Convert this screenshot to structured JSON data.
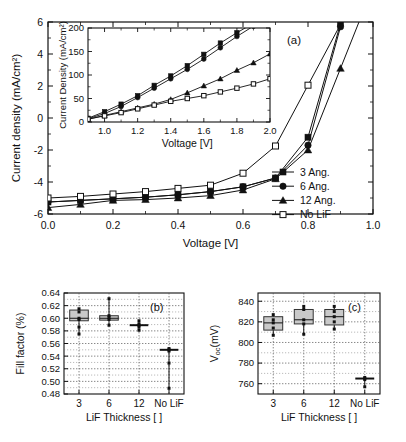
{
  "figure": {
    "panels": [
      "a",
      "b",
      "c"
    ]
  },
  "chart_data": [
    {
      "id": "panel-a",
      "type": "line",
      "panel_label": "(a)",
      "title": "",
      "xlabel": "Voltage [V]",
      "ylabel": "Current density (mA/cm²)",
      "xlim": [
        0.0,
        1.0
      ],
      "ylim": [
        -6,
        6
      ],
      "xticks": [
        0.0,
        0.2,
        0.4,
        0.6,
        0.8,
        1.0
      ],
      "xticklabels": [
        "0.0",
        "0.2",
        "0.4",
        "0.6",
        "0.8",
        "1.0"
      ],
      "yticks": [
        -6,
        -4,
        -2,
        0,
        2,
        4,
        6
      ],
      "yticklabels": [
        "-6",
        "-4",
        "-2",
        "0",
        "2",
        "4",
        "6"
      ],
      "grid": false,
      "legend_position": "lower-right",
      "series": [
        {
          "name": "3 Ang.",
          "marker": "filled-square",
          "x": [
            0.0,
            0.1,
            0.2,
            0.3,
            0.4,
            0.5,
            0.6,
            0.7,
            0.8,
            0.9
          ],
          "y": [
            -5.25,
            -5.15,
            -5.05,
            -4.95,
            -4.8,
            -4.6,
            -4.3,
            -3.75,
            -1.2,
            5.9
          ]
        },
        {
          "name": "6 Ang.",
          "marker": "filled-circle",
          "x": [
            0.0,
            0.1,
            0.2,
            0.3,
            0.4,
            0.5,
            0.6,
            0.7,
            0.8,
            0.9
          ],
          "y": [
            -5.25,
            -5.15,
            -5.05,
            -4.95,
            -4.8,
            -4.6,
            -4.3,
            -3.75,
            -1.7,
            5.7
          ]
        },
        {
          "name": "12 Ang.",
          "marker": "filled-triangle",
          "x": [
            0.0,
            0.1,
            0.2,
            0.3,
            0.4,
            0.5,
            0.6,
            0.7,
            0.8,
            0.9
          ],
          "y": [
            -5.6,
            -5.4,
            -5.15,
            -5.1,
            -5.0,
            -4.85,
            -4.5,
            -3.8,
            -2.0,
            3.1
          ]
        },
        {
          "name": "No LiF",
          "marker": "open-square",
          "x": [
            0.0,
            0.1,
            0.2,
            0.3,
            0.4,
            0.5,
            0.6,
            0.7,
            0.8
          ],
          "y": [
            -5.0,
            -4.9,
            -4.75,
            -4.6,
            -4.4,
            -4.2,
            -3.45,
            -1.75,
            2.05
          ]
        }
      ],
      "legend": [
        "3 Ang.",
        "6 Ang.",
        "12 Ang.",
        "No LiF"
      ]
    },
    {
      "id": "panel-a-inset",
      "type": "line",
      "title": "",
      "xlabel": "Voltage [V]",
      "ylabel": "Current Density (mA/cm²)",
      "xlim": [
        0.9,
        2.0
      ],
      "ylim": [
        0,
        200
      ],
      "xticks": [
        1.0,
        1.2,
        1.4,
        1.6,
        1.8,
        2.0
      ],
      "xticklabels": [
        "1.0",
        "1.2",
        "1.4",
        "1.6",
        "1.8",
        "2.0"
      ],
      "yticks": [
        0,
        50,
        100,
        150,
        200
      ],
      "yticklabels": [
        "0",
        "50",
        "100",
        "150",
        "200"
      ],
      "grid": false,
      "series": [
        {
          "name": "3 Ang.",
          "marker": "filled-square",
          "x": [
            0.9,
            1.0,
            1.1,
            1.2,
            1.3,
            1.4,
            1.5,
            1.6,
            1.7,
            1.8,
            1.9,
            2.0
          ],
          "y": [
            8,
            22,
            38,
            56,
            78,
            98,
            120,
            144,
            168,
            190,
            210,
            232
          ]
        },
        {
          "name": "6 Ang.",
          "marker": "filled-circle",
          "x": [
            0.9,
            1.0,
            1.1,
            1.2,
            1.3,
            1.4,
            1.5,
            1.6,
            1.7,
            1.8,
            1.9,
            2.0
          ],
          "y": [
            7,
            18,
            33,
            52,
            72,
            92,
            112,
            134,
            158,
            182,
            204,
            228
          ]
        },
        {
          "name": "12 Ang.",
          "marker": "filled-triangle",
          "x": [
            0.9,
            1.0,
            1.1,
            1.2,
            1.3,
            1.4,
            1.5,
            1.6,
            1.7,
            1.8,
            1.9,
            2.0
          ],
          "y": [
            6,
            14,
            22,
            30,
            38,
            48,
            62,
            77,
            92,
            110,
            126,
            145
          ]
        },
        {
          "name": "No LiF",
          "marker": "open-square",
          "x": [
            0.9,
            1.0,
            1.1,
            1.2,
            1.3,
            1.4,
            1.5,
            1.6,
            1.7,
            1.8,
            1.9,
            2.0
          ],
          "y": [
            6,
            13,
            20,
            28,
            36,
            44,
            50,
            56,
            64,
            72,
            81,
            92
          ]
        }
      ]
    },
    {
      "id": "panel-b",
      "type": "box",
      "panel_label": "(b)",
      "title": "",
      "xlabel": "LiF Thickness [ ]",
      "ylabel": "Fill factor (%)",
      "ylim": [
        0.48,
        0.64
      ],
      "yticks": [
        0.48,
        0.5,
        0.52,
        0.54,
        0.56,
        0.58,
        0.6,
        0.62,
        0.64
      ],
      "yticklabels": [
        "0.48",
        "0.50",
        "0.52",
        "0.54",
        "0.56",
        "0.58",
        "0.60",
        "0.62",
        "0.64"
      ],
      "categories": [
        "3",
        "6",
        "12",
        "No LiF"
      ],
      "grid": true,
      "boxes": [
        {
          "category": "3",
          "low": 0.596,
          "high": 0.613,
          "median": 0.6,
          "whisker_low": 0.575,
          "whisker_high": 0.615,
          "points": [
            0.615,
            0.61,
            0.6,
            0.598,
            0.586,
            0.575
          ]
        },
        {
          "category": "6",
          "low": 0.597,
          "high": 0.604,
          "median": 0.6,
          "whisker_low": 0.589,
          "whisker_high": 0.631,
          "points": [
            0.631,
            0.604,
            0.601,
            0.598,
            0.589
          ]
        },
        {
          "category": "12",
          "low": 0.586,
          "high": 0.591,
          "median": 0.589,
          "whisker_low": 0.581,
          "whisker_high": 0.596,
          "points": [
            0.596,
            0.591,
            0.589,
            0.586,
            0.581
          ]
        },
        {
          "category": "No LiF",
          "low": 0.548,
          "high": 0.552,
          "median": 0.55,
          "whisker_low": 0.489,
          "whisker_high": 0.552,
          "points": [
            0.552,
            0.55,
            0.548,
            0.529,
            0.489
          ]
        }
      ]
    },
    {
      "id": "panel-c",
      "type": "box",
      "panel_label": "(c)",
      "title": "",
      "xlabel": "LiF Thickness [ ]",
      "ylabel": "Vₒₑ(mV)",
      "ylabel_main": "V",
      "ylabel_sub": "oc",
      "ylabel_unit": "(mV)",
      "ylim": [
        750,
        848
      ],
      "yticks": [
        760,
        780,
        800,
        820,
        840
      ],
      "yticklabels": [
        "760",
        "780",
        "800",
        "820",
        "840"
      ],
      "categories": [
        "3",
        "6",
        "12",
        "No LiF"
      ],
      "grid": true,
      "boxes": [
        {
          "category": "3",
          "low": 812,
          "high": 825,
          "median": 819,
          "whisker_low": 807,
          "whisker_high": 827,
          "points": [
            827,
            822,
            819,
            814,
            807
          ]
        },
        {
          "category": "6",
          "low": 818,
          "high": 832,
          "median": 822,
          "whisker_low": 808,
          "whisker_high": 835,
          "points": [
            835,
            832,
            822,
            818,
            808
          ]
        },
        {
          "category": "12",
          "low": 817,
          "high": 832,
          "median": 825,
          "whisker_low": 813,
          "whisker_high": 835,
          "points": [
            835,
            830,
            825,
            820,
            813
          ]
        },
        {
          "category": "No LiF",
          "low": 764,
          "high": 766,
          "median": 765,
          "whisker_low": 757,
          "whisker_high": 766,
          "points": [
            766,
            765,
            764,
            757
          ]
        }
      ]
    }
  ]
}
